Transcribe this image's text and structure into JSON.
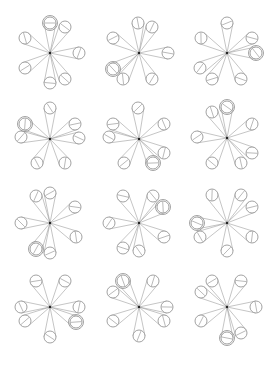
{
  "diagram": {
    "stroke_color": "#8a8a8a",
    "center_color": "#222222",
    "circle_radius": 6,
    "double_outer_radius": 7.5,
    "figures": [
      {
        "center": [
          50,
          53
        ],
        "circles": [
          [
            50,
            23,
            1
          ],
          [
            65,
            27,
            0
          ],
          [
            25,
            38,
            0
          ],
          [
            79,
            53,
            0
          ],
          [
            25,
            68,
            0
          ],
          [
            50,
            83,
            0
          ],
          [
            65,
            79,
            0
          ]
        ]
      },
      {
        "center": [
          139,
          53
        ],
        "circles": [
          [
            138,
            23,
            0
          ],
          [
            152,
            27,
            0
          ],
          [
            113,
            38,
            0
          ],
          [
            168,
            53,
            0
          ],
          [
            113,
            69,
            1
          ],
          [
            123,
            79,
            0
          ],
          [
            152,
            79,
            0
          ]
        ]
      },
      {
        "center": [
          227,
          53
        ],
        "circles": [
          [
            227,
            23,
            0
          ],
          [
            252,
            38,
            0
          ],
          [
            256,
            53,
            1
          ],
          [
            201,
            38,
            0
          ],
          [
            200,
            68,
            0
          ],
          [
            212,
            79,
            0
          ],
          [
            241,
            79,
            0
          ]
        ]
      },
      {
        "center": [
          50,
          139
        ],
        "circles": [
          [
            50,
            108,
            0
          ],
          [
            25,
            124,
            1
          ],
          [
            21,
            137,
            0
          ],
          [
            75,
            124,
            0
          ],
          [
            79,
            138,
            0
          ],
          [
            37,
            163,
            0
          ],
          [
            65,
            163,
            0
          ]
        ]
      },
      {
        "center": [
          139,
          139
        ],
        "circles": [
          [
            138,
            108,
            0
          ],
          [
            113,
            124,
            0
          ],
          [
            109,
            137,
            0
          ],
          [
            164,
            124,
            0
          ],
          [
            164,
            153,
            0
          ],
          [
            124,
            163,
            0
          ],
          [
            153,
            163,
            1
          ]
        ]
      },
      {
        "center": [
          227,
          138
        ],
        "circles": [
          [
            227,
            107,
            1
          ],
          [
            212,
            112,
            0
          ],
          [
            252,
            124,
            0
          ],
          [
            197,
            137,
            0
          ],
          [
            252,
            153,
            0
          ],
          [
            212,
            163,
            0
          ],
          [
            241,
            163,
            0
          ]
        ]
      },
      {
        "center": [
          50,
          223
        ],
        "circles": [
          [
            36,
            196,
            0
          ],
          [
            50,
            193,
            0
          ],
          [
            75,
            207,
            0
          ],
          [
            21,
            223,
            0
          ],
          [
            76,
            237,
            0
          ],
          [
            36,
            249,
            1
          ],
          [
            50,
            253,
            0
          ]
        ]
      },
      {
        "center": [
          139,
          223
        ],
        "circles": [
          [
            123,
            196,
            0
          ],
          [
            153,
            196,
            0
          ],
          [
            163,
            207,
            1
          ],
          [
            109,
            223,
            0
          ],
          [
            164,
            237,
            0
          ],
          [
            123,
            248,
            0
          ],
          [
            139,
            251,
            0
          ]
        ]
      },
      {
        "center": [
          227,
          223
        ],
        "circles": [
          [
            212,
            195,
            0
          ],
          [
            241,
            195,
            0
          ],
          [
            252,
            207,
            0
          ],
          [
            197,
            223,
            1
          ],
          [
            200,
            237,
            0
          ],
          [
            252,
            237,
            0
          ],
          [
            227,
            251,
            0
          ]
        ]
      },
      {
        "center": [
          50,
          307
        ],
        "circles": [
          [
            36,
            281,
            0
          ],
          [
            65,
            281,
            0
          ],
          [
            21,
            307,
            0
          ],
          [
            79,
            307,
            0
          ],
          [
            25,
            321,
            0
          ],
          [
            76,
            322,
            1
          ],
          [
            50,
            337,
            0
          ]
        ]
      },
      {
        "center": [
          139,
          307
        ],
        "circles": [
          [
            123,
            281,
            1
          ],
          [
            153,
            281,
            0
          ],
          [
            113,
            292,
            0
          ],
          [
            167,
            307,
            0
          ],
          [
            113,
            321,
            0
          ],
          [
            164,
            321,
            0
          ],
          [
            139,
            336,
            0
          ]
        ]
      },
      {
        "center": [
          227,
          307
        ],
        "circles": [
          [
            212,
            281,
            0
          ],
          [
            241,
            281,
            0
          ],
          [
            201,
            292,
            0
          ],
          [
            256,
            307,
            0
          ],
          [
            201,
            321,
            0
          ],
          [
            241,
            333,
            0
          ],
          [
            227,
            338,
            1
          ]
        ]
      }
    ]
  }
}
